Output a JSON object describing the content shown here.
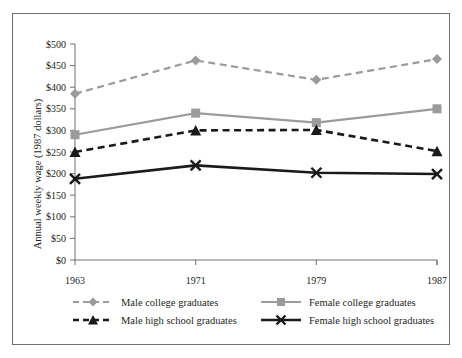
{
  "chart_data": {
    "type": "line",
    "title": "",
    "xlabel": "",
    "ylabel": "Annual weekly wage (1987 dollars)",
    "categories": [
      "1963",
      "1971",
      "1979",
      "1987"
    ],
    "x": [
      1963,
      1971,
      1979,
      1987
    ],
    "ylim": [
      0,
      500
    ],
    "ytick_values": [
      0,
      50,
      100,
      150,
      200,
      250,
      300,
      350,
      400,
      450,
      500
    ],
    "ytick_labels": [
      "$0",
      "$50",
      "$100",
      "$150",
      "$200",
      "$250",
      "$300",
      "$350",
      "$400",
      "$450",
      "$500"
    ],
    "grid": false,
    "legend_position": "below",
    "series": [
      {
        "name": "Male college graduates",
        "values": [
          385,
          462,
          417,
          465
        ],
        "color": "#9b9b9b",
        "line_style": "dashed",
        "marker": "diamond"
      },
      {
        "name": "Female college graduates",
        "values": [
          290,
          340,
          318,
          350
        ],
        "color": "#9b9b9b",
        "line_style": "solid",
        "marker": "square"
      },
      {
        "name": "Male high school graduates",
        "values": [
          250,
          300,
          301,
          252
        ],
        "color": "#1a1a1a",
        "line_style": "dashed",
        "marker": "triangle"
      },
      {
        "name": "Female high school graduates",
        "values": [
          188,
          219,
          202,
          199
        ],
        "color": "#1a1a1a",
        "line_style": "solid",
        "marker": "x"
      }
    ]
  },
  "legend": {
    "entries": [
      {
        "label": "Male college graduates"
      },
      {
        "label": "Female college graduates"
      },
      {
        "label": "Male high school graduates"
      },
      {
        "label": "Female high school graduates"
      }
    ]
  }
}
